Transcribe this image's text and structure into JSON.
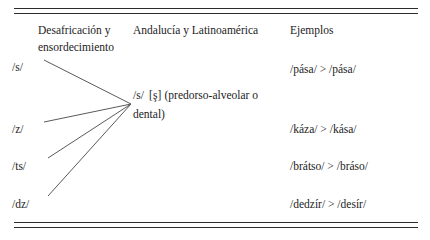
{
  "figure": {
    "type": "linguistic-merger-table",
    "headers": {
      "col1": "Desafricación y\nensordecimiento",
      "col2": "Andalucía y Latinoamérica",
      "col3": "Ejemplos"
    },
    "source_phonemes": [
      {
        "label": "/s/",
        "y": 60
      },
      {
        "label": "/z/",
        "y": 122
      },
      {
        "label": "/ts/",
        "y": 159
      },
      {
        "label": "/dz/",
        "y": 197
      }
    ],
    "merged": {
      "phoneme": "/s/",
      "allophone": "[ş]",
      "description": "(predorso-alveolar o dental)"
    },
    "examples": [
      {
        "text": "/pása/ > /pása/",
        "y": 62
      },
      {
        "text": "/káza/ > /kása/",
        "y": 122
      },
      {
        "text": "/brátso/ > /bráso/",
        "y": 159
      },
      {
        "text": "/dedzír/ > /desír/",
        "y": 197
      }
    ],
    "connector": {
      "target_x": 131,
      "target_y": 104,
      "origins": [
        {
          "x": 44,
          "y": 60
        },
        {
          "x": 44,
          "y": 122
        },
        {
          "x": 48,
          "y": 158
        },
        {
          "x": 48,
          "y": 196
        }
      ],
      "color": "#5a5a5a"
    },
    "rules_color": "#2b2b2b"
  }
}
